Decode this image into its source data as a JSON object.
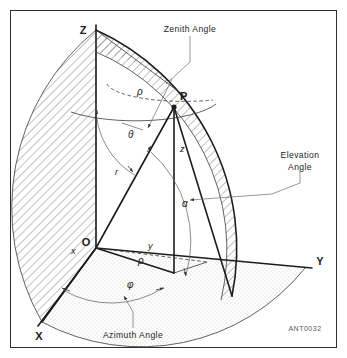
{
  "figure": {
    "reference_code": "ANT0032",
    "frame_color": "#2e2e32",
    "line_color": "#1c1c1c",
    "hatch_color": "#6b6b70",
    "stipple_color": "#9a9aa0"
  },
  "axes": [
    {
      "id": "z-axis",
      "label": "Z"
    },
    {
      "id": "y-axis",
      "label": "Y"
    },
    {
      "id": "x-axis",
      "label": "X"
    }
  ],
  "points": [
    {
      "id": "point-p",
      "label": "P"
    },
    {
      "id": "origin",
      "label": "O"
    }
  ],
  "variables": [
    {
      "id": "rho-upper",
      "label": "ρ"
    },
    {
      "id": "theta",
      "label": "θ"
    },
    {
      "id": "radius-r",
      "label": "r"
    },
    {
      "id": "height-z",
      "label": "z"
    },
    {
      "id": "alpha",
      "label": "α"
    },
    {
      "id": "coord-x",
      "label": "x"
    },
    {
      "id": "coord-y",
      "label": "y"
    },
    {
      "id": "rho-lower",
      "label": "ρ"
    },
    {
      "id": "phi",
      "label": "φ"
    }
  ],
  "callouts": [
    {
      "id": "zenith-angle",
      "lines": [
        "Zenith  Angle"
      ]
    },
    {
      "id": "elevation-angle",
      "lines": [
        "Elevation",
        "Angle"
      ]
    },
    {
      "id": "azimuth-angle",
      "lines": [
        "Azimuth  Angle"
      ]
    }
  ]
}
